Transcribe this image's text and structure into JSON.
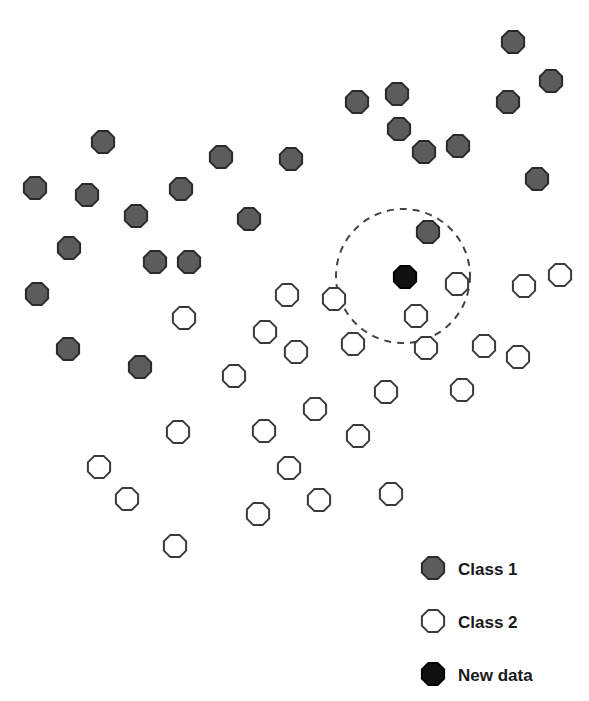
{
  "chart_data": {
    "type": "scatter",
    "title": "",
    "xlabel": "",
    "ylabel": "",
    "grid": false,
    "axes_visible": false,
    "legend_position": "bottom-right",
    "coordinate_space": "pixel",
    "marker_shape": "octagon",
    "marker_radius": 12,
    "neighborhood_circle": {
      "cx": 403,
      "cy": 276,
      "r": 67,
      "style": "dashed"
    },
    "series": [
      {
        "name": "Class 1",
        "fill": "#5c5c5c",
        "stroke": "#2a2a2a",
        "points": [
          [
            513,
            42
          ],
          [
            551,
            81
          ],
          [
            508,
            102
          ],
          [
            357,
            102
          ],
          [
            397,
            94
          ],
          [
            399,
            129
          ],
          [
            424,
            152
          ],
          [
            458,
            146
          ],
          [
            537,
            179
          ],
          [
            103,
            142
          ],
          [
            221,
            157
          ],
          [
            291,
            159
          ],
          [
            35,
            188
          ],
          [
            87,
            195
          ],
          [
            181,
            189
          ],
          [
            136,
            216
          ],
          [
            249,
            219
          ],
          [
            69,
            248
          ],
          [
            155,
            262
          ],
          [
            189,
            262
          ],
          [
            428,
            232
          ],
          [
            37,
            294
          ],
          [
            68,
            349
          ],
          [
            140,
            367
          ]
        ]
      },
      {
        "name": "Class 2",
        "fill": "#ffffff",
        "stroke": "#3a3a3a",
        "points": [
          [
            184,
            318
          ],
          [
            287,
            295
          ],
          [
            334,
            299
          ],
          [
            265,
            332
          ],
          [
            296,
            352
          ],
          [
            234,
            376
          ],
          [
            457,
            284
          ],
          [
            416,
            316
          ],
          [
            353,
            344
          ],
          [
            426,
            348
          ],
          [
            524,
            286
          ],
          [
            560,
            275
          ],
          [
            484,
            346
          ],
          [
            518,
            357
          ],
          [
            386,
            392
          ],
          [
            462,
            390
          ],
          [
            315,
            409
          ],
          [
            178,
            432
          ],
          [
            264,
            431
          ],
          [
            358,
            436
          ],
          [
            99,
            467
          ],
          [
            289,
            468
          ],
          [
            127,
            499
          ],
          [
            319,
            500
          ],
          [
            391,
            494
          ],
          [
            258,
            514
          ],
          [
            175,
            546
          ]
        ]
      },
      {
        "name": "New data",
        "fill": "#111111",
        "stroke": "#000000",
        "points": [
          [
            405,
            277
          ]
        ]
      }
    ],
    "legend": [
      {
        "label": "Class 1",
        "fill": "#5c5c5c",
        "stroke": "#2a2a2a"
      },
      {
        "label": "Class 2",
        "fill": "#ffffff",
        "stroke": "#3a3a3a"
      },
      {
        "label": "New data",
        "fill": "#111111",
        "stroke": "#000000"
      }
    ]
  },
  "legend": {
    "items": [
      {
        "label": "Class 1"
      },
      {
        "label": "Class 2"
      },
      {
        "label": "New data"
      }
    ]
  }
}
